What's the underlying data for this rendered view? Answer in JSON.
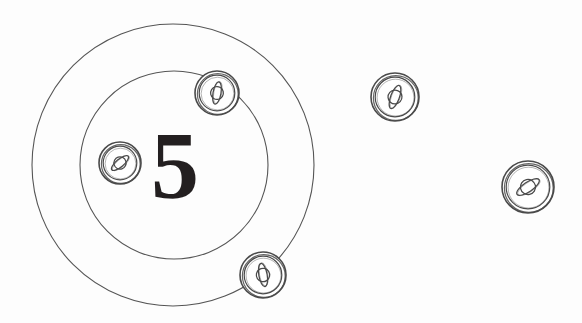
{
  "canvas": {
    "width": 582,
    "height": 323,
    "background_color": "#fdfdfd",
    "stroke_color": "#555555",
    "token_stroke_color": "#4a4a4a",
    "numeral_color": "#231f20"
  },
  "scene": {
    "title": "Saturn token counting scene",
    "description": "Two concentric thin outline circles with a large numeral 5 inside, and five saturn-planet tokens scattered across the canvas",
    "numeral": {
      "name": "count-numeral",
      "value": "5",
      "x": 175,
      "y": 165,
      "font_size": 96
    },
    "rings": [
      {
        "name": "outer-ring",
        "cx": 173,
        "cy": 165,
        "r": 141,
        "stroke_width": 1.1
      },
      {
        "name": "inner-ring",
        "cx": 174,
        "cy": 165,
        "r": 94,
        "stroke_width": 1.1
      }
    ],
    "tokens": [
      {
        "name": "token-top-inside",
        "label": "saturn-token-1",
        "cx": 217,
        "cy": 93,
        "r": 22,
        "rotation": -58,
        "inside_rings": "inner-edge"
      },
      {
        "name": "token-left-inside",
        "label": "saturn-token-2",
        "cx": 120,
        "cy": 163,
        "r": 21,
        "rotation": -18,
        "inside_rings": "inner"
      },
      {
        "name": "token-bottom-edge",
        "label": "saturn-token-3",
        "cx": 263,
        "cy": 275,
        "r": 23,
        "rotation": -78,
        "inside_rings": "outer-edge"
      },
      {
        "name": "token-right-upper",
        "label": "saturn-token-4",
        "cx": 395,
        "cy": 97,
        "r": 24,
        "rotation": -48,
        "inside_rings": "outside"
      },
      {
        "name": "token-right-lower",
        "label": "saturn-token-5",
        "cx": 528,
        "cy": 187,
        "r": 26,
        "rotation": -12,
        "inside_rings": "outside"
      }
    ]
  },
  "chart_data": {
    "type": "scatter",
    "xlabel": "",
    "ylabel": "",
    "xlim": [
      0,
      582
    ],
    "ylim": [
      0,
      323
    ],
    "grid": false,
    "legend": "none",
    "annotations": [
      {
        "text": "5",
        "x": 175,
        "y": 165,
        "role": "count-numeral"
      }
    ],
    "series": [
      {
        "name": "saturn-tokens",
        "marker": "saturn-coin",
        "x": [
          217,
          120,
          263,
          395,
          528
        ],
        "y": [
          93,
          163,
          275,
          97,
          187
        ],
        "sizes": [
          22,
          21,
          23,
          24,
          26
        ],
        "rotations": [
          -58,
          -18,
          -78,
          -48,
          -12
        ]
      },
      {
        "name": "rings",
        "marker": "circle-outline",
        "x": [
          173,
          174
        ],
        "y": [
          165,
          165
        ],
        "sizes": [
          141,
          94
        ]
      }
    ],
    "values": [
      5
    ]
  }
}
